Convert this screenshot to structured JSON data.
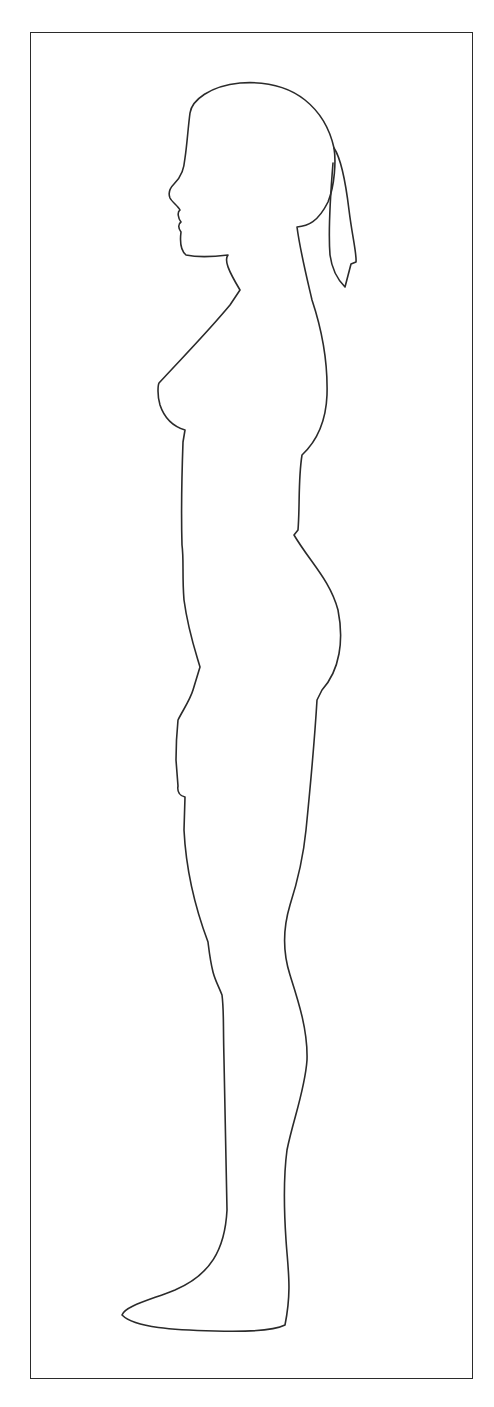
{
  "figure": {
    "type": "outline drawing",
    "stroke_color": "#2b2b2b",
    "background_color": "#ffffff",
    "frame": {
      "present": true,
      "stroke_color": "#2b2b2b"
    }
  }
}
